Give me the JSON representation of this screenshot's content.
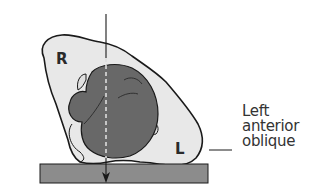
{
  "diagram": {
    "title": "Left anterior oblique",
    "labels": {
      "right": "R",
      "left": "L"
    },
    "caption_lines": [
      "Left",
      "anterior",
      "oblique"
    ],
    "colors": {
      "body_outline_fill": "#e6e6e6",
      "organ_fill": "#6b6b6b",
      "table_fill": "#8a8a8a",
      "stroke": "#1a1a1a",
      "beam_dash": "#d8d8d8"
    },
    "elements": [
      "body cross-section",
      "heart (dark)",
      "x-ray beam arrow",
      "table/platform",
      "leader line"
    ]
  }
}
